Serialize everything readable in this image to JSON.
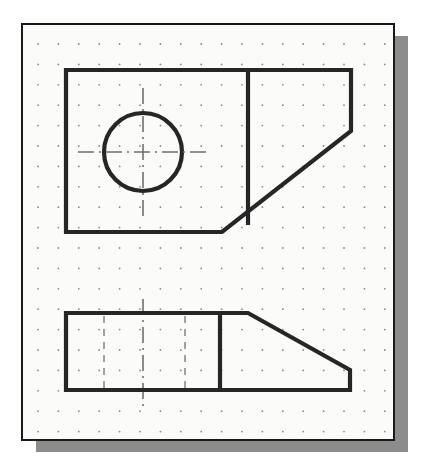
{
  "canvas": {
    "width": 424,
    "height": 476,
    "background_color": "#ffffff",
    "title": "Orthographic drawing of angled block - top view and front view on grid paper"
  },
  "colors": {
    "paper": "#fbfbfa",
    "frame_line": "#1a1a1a",
    "shadow": "#8c8c8c",
    "object_line": "#262626",
    "grid_dot": "#8a8a8a",
    "center_line": "#707070",
    "hidden_line": "#8a8a8a"
  },
  "sheet": {
    "label": "grid-paper-sheet",
    "x": 22,
    "y": 24,
    "width": 372,
    "height": 416,
    "border_width": 2,
    "shadow_offset_x": 14,
    "shadow_offset_y": 12
  },
  "grid": {
    "label": "dot-grid",
    "origin_x": 38,
    "origin_y": 44,
    "spacing": 20.4,
    "columns": 18,
    "rows": 20,
    "dot_radius": 0.9,
    "visible": true
  },
  "views": [
    {
      "name": "top-view",
      "description": "Upper orthographic view: rectangle with chamfered lower-right corner, vertical partition line and a through hole shown as a circle with centerlines",
      "outline_points": "66,70 351,70 351,131 222,232 66,232",
      "line_width": 4.2,
      "partition_line": {
        "x": 248,
        "y1": 70,
        "y2": 225
      },
      "hole": {
        "name": "through-hole-circle",
        "center_x": 143,
        "center_y": 152,
        "radius": 39,
        "line_width": 4.2
      },
      "centerlines": {
        "horizontal": {
          "x1": 78,
          "x2": 210,
          "y": 152
        },
        "vertical": {
          "y1": 88,
          "y2": 218,
          "x": 143
        }
      }
    },
    {
      "name": "front-view",
      "description": "Lower orthographic view: rectangle with angled top-right edge (chamfer), vertical partition line and two hidden lines indicating the hole",
      "outline_points": "66,313 248,313 350,370 350,390 66,390",
      "line_width": 4.2,
      "partition_line": {
        "x": 220,
        "y1": 313,
        "y2": 390
      },
      "hidden_lines": [
        {
          "name": "hidden-line-left",
          "x": 104,
          "y1": 316,
          "y2": 388
        },
        {
          "name": "hidden-line-right",
          "x": 185,
          "y1": 316,
          "y2": 388
        }
      ],
      "centerline": {
        "x": 143,
        "y1": 299,
        "y2": 406
      }
    }
  ],
  "line_styles": {
    "object_line_label": "visible object line",
    "hidden_line_label": "hidden line (dashed)",
    "center_line_label": "center line (dash-dot)",
    "hidden_dash_pattern": "7,6",
    "center_dash_pattern": "16,5,2,5"
  }
}
